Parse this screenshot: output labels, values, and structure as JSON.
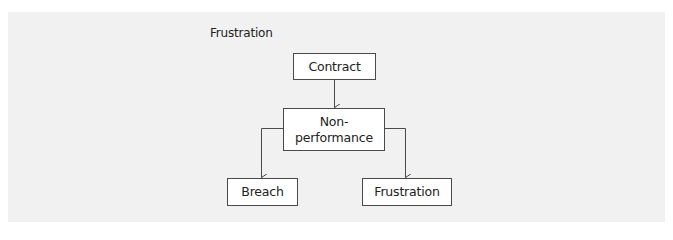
{
  "diagram": {
    "title": "Frustration",
    "nodes": {
      "contract": {
        "label": "Contract"
      },
      "non_performance": {
        "line1": "Non-",
        "line2": "performance"
      },
      "breach": {
        "label": "Breach"
      },
      "frustration": {
        "label": "Frustration"
      }
    },
    "edges": [
      {
        "from": "Contract",
        "to": "Non-performance"
      },
      {
        "from": "Non-performance",
        "to": "Breach"
      },
      {
        "from": "Non-performance",
        "to": "Frustration"
      }
    ],
    "colors": {
      "panel_background": "#f1f1f1",
      "node_fill": "#ffffff",
      "stroke": "#4a4a4a",
      "text": "#222222"
    }
  }
}
